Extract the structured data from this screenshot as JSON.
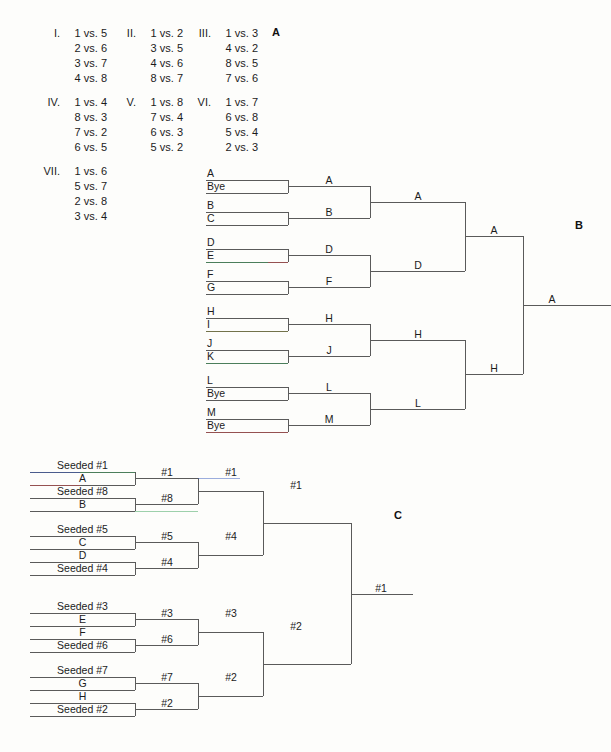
{
  "panels": {
    "a_label": "A",
    "b_label": "B",
    "c_label": "C"
  },
  "schedule": {
    "rounds": [
      {
        "numeral": "I.",
        "matches": [
          "1 vs. 5",
          "2 vs. 6",
          "3 vs. 7",
          "4 vs. 8"
        ]
      },
      {
        "numeral": "II.",
        "matches": [
          "1 vs. 2",
          "3 vs. 5",
          "4 vs. 6",
          "8 vs. 7"
        ]
      },
      {
        "numeral": "III.",
        "matches": [
          "1 vs. 3",
          "4 vs. 2",
          "8 vs. 5",
          "7 vs. 6"
        ]
      },
      {
        "numeral": "IV.",
        "matches": [
          "1 vs. 4",
          "8 vs. 3",
          "7 vs. 2",
          "6 vs. 5"
        ]
      },
      {
        "numeral": "V.",
        "matches": [
          "1 vs. 8",
          "7 vs. 4",
          "6 vs. 3",
          "5 vs. 2"
        ]
      },
      {
        "numeral": "VI.",
        "matches": [
          "1 vs. 7",
          "6 vs. 8",
          "5 vs. 4",
          "2 vs. 3"
        ]
      },
      {
        "numeral": "VII.",
        "matches": [
          "1 vs. 6",
          "5 vs. 7",
          "2 vs. 8",
          "3 vs. 4"
        ]
      }
    ]
  },
  "bracket_b": {
    "seeds": [
      {
        "top": "A",
        "bottom": "Bye"
      },
      {
        "top": "B",
        "bottom": "C"
      },
      {
        "top": "D",
        "bottom": "E"
      },
      {
        "top": "F",
        "bottom": "G"
      },
      {
        "top": "H",
        "bottom": "I"
      },
      {
        "top": "J",
        "bottom": "K"
      },
      {
        "top": "L",
        "bottom": "Bye"
      },
      {
        "top": "M",
        "bottom": "Bye"
      }
    ],
    "round2": [
      "A",
      "B",
      "D",
      "F",
      "H",
      "J",
      "L",
      "M"
    ],
    "round3": [
      "A",
      "D",
      "H",
      "L"
    ],
    "round4": [
      "A",
      "H"
    ],
    "champion": "A"
  },
  "bracket_c": {
    "seeds": [
      {
        "top": "Seeded #1",
        "bottom": "A"
      },
      {
        "top": "Seeded #8",
        "bottom": "B"
      },
      {
        "top": "Seeded #5",
        "bottom": "C"
      },
      {
        "top": "D",
        "bottom": "Seeded #4"
      },
      {
        "top": "Seeded #3",
        "bottom": "E"
      },
      {
        "top": "F",
        "bottom": "Seeded #6"
      },
      {
        "top": "Seeded #7",
        "bottom": "G"
      },
      {
        "top": "H",
        "bottom": "Seeded #2"
      }
    ],
    "round2": [
      "#1",
      "#8",
      "#5",
      "#4",
      "#3",
      "#6",
      "#7",
      "#2"
    ],
    "round3": [
      "#1",
      "#4",
      "#3",
      "#2"
    ],
    "round4": [
      "#1",
      "#2"
    ],
    "champion": "#1"
  },
  "colors": {
    "line": "#5a5a5a",
    "text": "#1b1b1b",
    "accent_blue": "#3b5fc0",
    "accent_red": "#d04a4a",
    "accent_green": "#3ea35c",
    "accent_olive": "#8a8a3c",
    "background": "#fdfdfb"
  }
}
